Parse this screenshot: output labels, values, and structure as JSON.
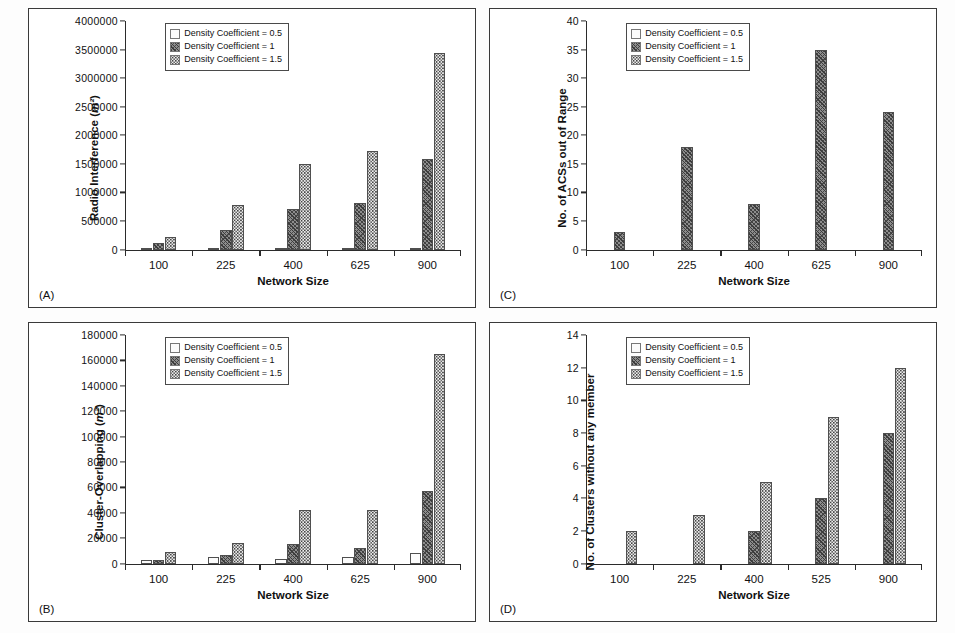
{
  "figure": {
    "panels": [
      "A",
      "B",
      "C",
      "D"
    ],
    "legend_entries": [
      {
        "label": "Density Coefficient = 0.5",
        "swatch": "stipple-light-swatch"
      },
      {
        "label": "Density Coefficient = 1",
        "swatch": "hatch-dark-swatch"
      },
      {
        "label": "Density Coefficient = 1.5",
        "swatch": "stipple-mid-swatch"
      }
    ]
  },
  "panel_a": {
    "tag": "(A)",
    "ylabel_text": "Radio Interference (",
    "ylabel_unit": "m²",
    "ylabel_close": ")",
    "xlabel": "Network Size"
  },
  "panel_b": {
    "tag": "(B)",
    "ylabel_text": "Cluster-Overlapping  (",
    "ylabel_unit": "m²",
    "ylabel_close": ")",
    "xlabel": "Network Size"
  },
  "panel_c": {
    "tag": "(C)",
    "ylabel_text": "No. of ACSs out of Range",
    "ylabel_unit": "",
    "ylabel_close": "",
    "xlabel": "Network Size"
  },
  "panel_d": {
    "tag": "(D)",
    "ylabel_text": "No. of Clusters  without any member",
    "ylabel_unit": "",
    "ylabel_close": "",
    "xlabel": "Network Size"
  },
  "chart_data": [
    {
      "id": "A",
      "type": "bar",
      "title": "",
      "xlabel": "Network Size",
      "ylabel": "Radio Interference (m²)",
      "categories": [
        "100",
        "225",
        "400",
        "625",
        "900"
      ],
      "ylim": [
        0,
        4000000
      ],
      "yticks": [
        0,
        500000,
        1000000,
        1500000,
        2000000,
        2500000,
        3000000,
        3500000,
        4000000
      ],
      "ytick_labels": [
        "0",
        "500000",
        "1000000",
        "1500000",
        "2000000",
        "2500000",
        "3000000",
        "3500000",
        "4000000"
      ],
      "grid": false,
      "legend_position": "top-left",
      "series": [
        {
          "name": "Density Coefficient = 0.5",
          "values": [
            10000,
            15000,
            20000,
            25000,
            30000
          ]
        },
        {
          "name": "Density Coefficient = 1",
          "values": [
            110000,
            340000,
            710000,
            820000,
            1590000
          ]
        },
        {
          "name": "Density Coefficient = 1.5",
          "values": [
            220000,
            780000,
            1500000,
            1720000,
            3440000
          ]
        }
      ]
    },
    {
      "id": "B",
      "type": "bar",
      "title": "",
      "xlabel": "Network Size",
      "ylabel": "Cluster-Overlapping (m²)",
      "categories": [
        "100",
        "225",
        "400",
        "625",
        "900"
      ],
      "ylim": [
        0,
        180000
      ],
      "yticks": [
        0,
        20000,
        40000,
        60000,
        80000,
        100000,
        120000,
        140000,
        160000,
        180000
      ],
      "ytick_labels": [
        "0",
        "20000",
        "40000",
        "60000",
        "80000",
        "100000",
        "120000",
        "140000",
        "160000",
        "180000"
      ],
      "grid": false,
      "legend_position": "top-left",
      "series": [
        {
          "name": "Density Coefficient = 0.5",
          "values": [
            2500,
            5500,
            3500,
            5000,
            8000
          ]
        },
        {
          "name": "Density Coefficient = 1",
          "values": [
            3000,
            6500,
            15500,
            12500,
            57500
          ]
        },
        {
          "name": "Density Coefficient = 1.5",
          "values": [
            9500,
            16500,
            42000,
            42500,
            165000
          ]
        }
      ]
    },
    {
      "id": "C",
      "type": "bar",
      "title": "",
      "xlabel": "Network Size",
      "ylabel": "No. of ACSs out of Range",
      "categories": [
        "100",
        "225",
        "400",
        "625",
        "900"
      ],
      "ylim": [
        0,
        40
      ],
      "yticks": [
        0,
        5,
        10,
        15,
        20,
        25,
        30,
        35,
        40
      ],
      "ytick_labels": [
        "0",
        "5",
        "10",
        "15",
        "20",
        "25",
        "30",
        "35",
        "40"
      ],
      "grid": false,
      "legend_position": "top-left",
      "series": [
        {
          "name": "Density Coefficient = 0.5",
          "values": [
            0,
            0,
            0,
            0,
            0
          ]
        },
        {
          "name": "Density Coefficient = 1",
          "values": [
            3,
            18,
            8,
            35,
            24
          ]
        },
        {
          "name": "Density Coefficient = 1.5",
          "values": [
            0,
            0,
            0,
            0,
            0
          ]
        }
      ]
    },
    {
      "id": "D",
      "type": "bar",
      "title": "",
      "xlabel": "Network Size",
      "ylabel": "No. of Clusters without any member",
      "categories": [
        "100",
        "225",
        "400",
        "525",
        "900"
      ],
      "ylim": [
        0,
        14
      ],
      "yticks": [
        0,
        2,
        4,
        6,
        8,
        10,
        12,
        14
      ],
      "ytick_labels": [
        "0",
        "2",
        "4",
        "6",
        "8",
        "10",
        "12",
        "14"
      ],
      "grid": false,
      "legend_position": "top-left",
      "series": [
        {
          "name": "Density Coefficient = 0.5",
          "values": [
            0,
            0,
            0,
            0,
            0
          ]
        },
        {
          "name": "Density Coefficient = 1",
          "values": [
            0,
            0,
            2,
            4,
            8
          ]
        },
        {
          "name": "Density Coefficient = 1.5",
          "values": [
            2,
            3,
            5,
            9,
            12
          ]
        }
      ]
    }
  ]
}
